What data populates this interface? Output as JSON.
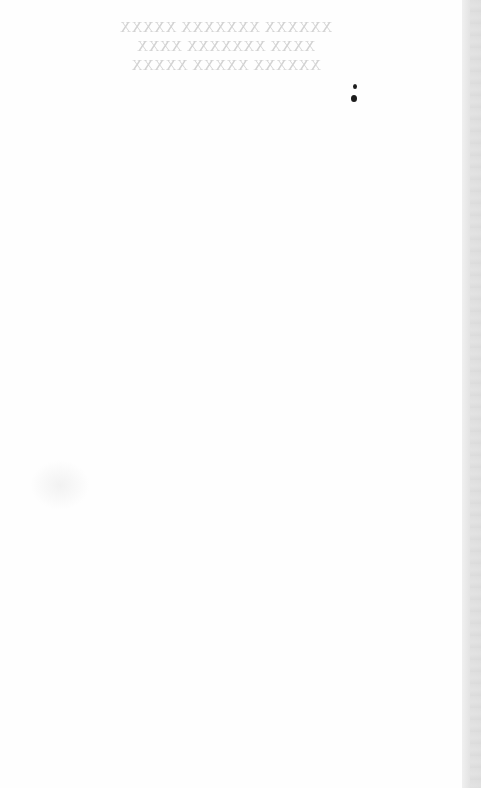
{
  "page": {
    "type": "scanned blank page",
    "show_through_text": {
      "mirrored": true,
      "lines": [
        "XXXXXX XXXXXXX XXXXX",
        "XXXX XXXXXXX XXXX",
        "XXXXXX XXXXX XXXXX"
      ]
    },
    "specks": 2,
    "colors": {
      "paper": "#fefefe",
      "ghost_text": "#d2d2d2",
      "speck": "#1c1c1c",
      "edge": "#dcdcdc"
    }
  }
}
